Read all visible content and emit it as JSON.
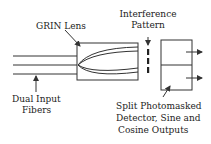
{
  "labels": {
    "grin_lens": "GRIN Lens",
    "interference_line1": "Interference",
    "interference_line2": "Pattern",
    "fibers_line1": "Dual Input",
    "fibers_line2": "Fibers",
    "detector_line1": "Split Photomasked",
    "detector_line2": "Detector, Sine and",
    "detector_line3": "Cosine Outputs"
  },
  "colors": {
    "stroke": "#333333",
    "background": "#ffffff"
  }
}
